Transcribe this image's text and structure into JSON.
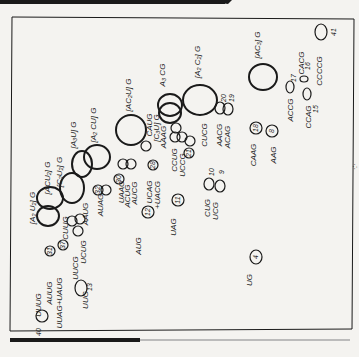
{
  "figure": {
    "type": "2D oligonucleotide fingerprint map (rotated)",
    "ink_color": "#1a1a1a",
    "paper_color": "#f4f3f0",
    "frame": {
      "x": 12,
      "y": 17,
      "w": 342,
      "h": 310
    }
  },
  "spots": [
    {
      "id": "spot-40",
      "label": "UUUG",
      "num": "40",
      "cx": 42,
      "cy": 316,
      "rx": 6,
      "ry": 6,
      "lx": 41,
      "ly": 305,
      "nx": 41,
      "ny": 332
    },
    {
      "id": "spot-13",
      "label": "UUG",
      "num": "13",
      "cx": 81,
      "cy": 288,
      "rx": 6,
      "ry": 8,
      "lx": 88,
      "ly": 300,
      "nx": 92,
      "ny": 287
    },
    {
      "id": "spot-auug",
      "label": "AUUG",
      "num": "",
      "cx": 0,
      "cy": 0,
      "rx": 0,
      "ry": 0,
      "lx": 52,
      "ly": 293
    },
    {
      "id": "spot-uuag",
      "label": "UUAG+UAUG",
      "num": "",
      "cx": 0,
      "cy": 0,
      "rx": 0,
      "ry": 0,
      "lx": 62,
      "ly": 303
    },
    {
      "id": "spot-31",
      "label": "",
      "num": "31",
      "cx": 50,
      "cy": 251,
      "rx": 5,
      "ry": 5
    },
    {
      "id": "spot-37",
      "label": "",
      "num": "37",
      "cx": 63,
      "cy": 245,
      "rx": 5,
      "ry": 5
    },
    {
      "id": "spot-uucg",
      "label": "UUCG",
      "num": "",
      "cx": 0,
      "cy": 0,
      "rx": 0,
      "ry": 0,
      "lx": 78,
      "ly": 268
    },
    {
      "id": "spot-ucug",
      "label": "UCUG",
      "num": "",
      "cx": 0,
      "cy": 0,
      "rx": 0,
      "ry": 0,
      "lx": 86,
      "ly": 252
    },
    {
      "id": "spot-aaug",
      "label": "AAUG",
      "num": "",
      "cx": 0,
      "cy": 0,
      "rx": 0,
      "ry": 0,
      "lx": 88,
      "ly": 214
    },
    {
      "id": "spot-cuug",
      "label": "CUUG",
      "num": "",
      "cx": 0,
      "cy": 0,
      "rx": 0,
      "ry": 0,
      "lx": 68,
      "ly": 228
    },
    {
      "id": "spot-29",
      "label": "",
      "num": "",
      "cx": 72,
      "cy": 221,
      "rx": 5,
      "ry": 5
    },
    {
      "id": "spot-33",
      "label": "",
      "num": "",
      "cx": 78,
      "cy": 231,
      "rx": 5,
      "ry": 5
    },
    {
      "id": "spot-34",
      "label": "",
      "num": "",
      "cx": 80,
      "cy": 219,
      "rx": 5,
      "ry": 5
    },
    {
      "id": "spot-a2u2",
      "label": "[A₂ U₂] G",
      "num": "",
      "cx": 50,
      "cy": 198,
      "rx": 13,
      "ry": 11,
      "cx2": 48,
      "cy2": 216,
      "rx2": 11,
      "ry2": 10,
      "lx": 35,
      "ly": 208
    },
    {
      "id": "spot-acu2",
      "label": "[ACU₂] G",
      "num": "",
      "cx": 72,
      "cy": 188,
      "rx": 12,
      "ry": 15,
      "lx": 50,
      "ly": 178
    },
    {
      "id": "spot-c2u2",
      "label": "[C₂U₂] G",
      "num": "",
      "cx": 0,
      "cy": 0,
      "rx": 0,
      "ry": 0,
      "lx": 62,
      "ly": 172
    },
    {
      "id": "spot-a3u",
      "label": "[A₃U] G",
      "num": "",
      "cx": 82,
      "cy": 164,
      "rx": 10,
      "ry": 13,
      "cx2": 97,
      "cy2": 157,
      "rx2": 13,
      "ry2": 12,
      "lx": 76,
      "ly": 135
    },
    {
      "id": "spot-a2cu",
      "label": "[A₂ CU] G",
      "num": "",
      "cx": 0,
      "cy": 0,
      "rx": 0,
      "ry": 0,
      "lx": 96,
      "ly": 125
    },
    {
      "id": "spot-auag",
      "label": "AUAG",
      "num": "",
      "cx": 0,
      "cy": 0,
      "rx": 0,
      "ry": 0,
      "lx": 103,
      "ly": 205
    },
    {
      "id": "spot-32",
      "label": "",
      "num": "32",
      "cx": 98,
      "cy": 190,
      "rx": 5,
      "ry": 5
    },
    {
      "id": "spot-32b",
      "label": "",
      "num": "",
      "cx": 106,
      "cy": 190,
      "rx": 5,
      "ry": 5
    },
    {
      "id": "spot-aca",
      "label": "",
      "num": "",
      "cx": 123,
      "cy": 164,
      "rx": 5,
      "ry": 5
    },
    {
      "id": "spot-acb",
      "label": "",
      "num": "",
      "cx": 131,
      "cy": 164,
      "rx": 5,
      "ry": 5
    },
    {
      "id": "spot-uaag",
      "label": "UAAG",
      "num": "",
      "cx": 0,
      "cy": 0,
      "rx": 0,
      "ry": 0,
      "lx": 124,
      "ly": 192
    },
    {
      "id": "spot-acug",
      "label": "ACUG",
      "num": "",
      "cx": 0,
      "cy": 0,
      "rx": 0,
      "ry": 0,
      "lx": 130,
      "ly": 196
    },
    {
      "id": "spot-aucg",
      "label": "AUCG",
      "num": "",
      "cx": 0,
      "cy": 0,
      "rx": 0,
      "ry": 0,
      "lx": 137,
      "ly": 193
    },
    {
      "id": "spot-30",
      "label": "",
      "num": "30",
      "cx": 119,
      "cy": 179,
      "rx": 5,
      "ry": 5
    },
    {
      "id": "spot-ac2u",
      "label": "[AC₂U] G",
      "num": "",
      "cx": 131,
      "cy": 130,
      "rx": 15,
      "ry": 15,
      "lx": 131,
      "ly": 95
    },
    {
      "id": "spot-caug",
      "label": "CAUG",
      "num": "",
      "cx": 0,
      "cy": 0,
      "rx": 0,
      "ry": 0,
      "lx": 152,
      "ly": 125
    },
    {
      "id": "spot-c3u",
      "label": "[C₃U] G",
      "num": "",
      "cx": 0,
      "cy": 0,
      "rx": 0,
      "ry": 0,
      "lx": 159,
      "ly": 128
    },
    {
      "id": "spot-aaag",
      "label": "AAAG",
      "num": "",
      "cx": 0,
      "cy": 0,
      "rx": 0,
      "ry": 0,
      "lx": 166,
      "ly": 137
    },
    {
      "id": "spot-26",
      "label": "",
      "num": "",
      "cx": 146,
      "cy": 146,
      "rx": 5,
      "ry": 5
    },
    {
      "id": "spot-28",
      "label": "",
      "num": "28",
      "cx": 153,
      "cy": 165,
      "rx": 5,
      "ry": 5
    },
    {
      "id": "spot-ucag",
      "label": "UCAG",
      "num": "",
      "cx": 0,
      "cy": 0,
      "rx": 0,
      "ry": 0,
      "lx": 152,
      "ly": 192
    },
    {
      "id": "spot-uacg",
      "label": "+UACG",
      "num": "",
      "cx": 0,
      "cy": 0,
      "rx": 0,
      "ry": 0,
      "lx": 160,
      "ly": 195
    },
    {
      "id": "spot-12",
      "label": "AUG",
      "num": "12",
      "cx": 148,
      "cy": 212,
      "rx": 6,
      "ry": 6,
      "lx": 141,
      "ly": 246
    },
    {
      "id": "spot-11",
      "label": "UAG",
      "num": "11",
      "cx": 178,
      "cy": 200,
      "rx": 6,
      "ry": 6,
      "lx": 176,
      "ly": 227
    },
    {
      "id": "spot-a3c",
      "label": "A₃ CG",
      "num": "",
      "cx": 170,
      "cy": 105,
      "rx": 12,
      "ry": 11,
      "cx2": 170,
      "cy2": 113,
      "rx2": 11,
      "ry2": 10,
      "lx": 165,
      "ly": 75
    },
    {
      "id": "spot-ccug",
      "label": "CCUG",
      "num": "",
      "cx": 0,
      "cy": 0,
      "rx": 0,
      "ry": 0,
      "lx": 177,
      "ly": 160
    },
    {
      "id": "spot-uccg",
      "label": "UCCG",
      "num": "",
      "cx": 0,
      "cy": 0,
      "rx": 0,
      "ry": 0,
      "lx": 185,
      "ly": 165
    },
    {
      "id": "spot-25",
      "label": "",
      "num": "",
      "cx": 176,
      "cy": 128,
      "rx": 5,
      "ry": 5
    },
    {
      "id": "spot-27",
      "label": "",
      "num": "",
      "cx": 175,
      "cy": 137,
      "rx": 5,
      "ry": 5
    },
    {
      "id": "spot-24",
      "label": "",
      "num": "",
      "cx": 182,
      "cy": 137,
      "rx": 5,
      "ry": 5
    },
    {
      "id": "spot-22",
      "label": "",
      "num": "",
      "cx": 190,
      "cy": 141,
      "rx": 5,
      "ry": 5
    },
    {
      "id": "spot-21",
      "label": "",
      "num": "21",
      "cx": 189,
      "cy": 153,
      "rx": 5,
      "ry": 5
    },
    {
      "id": "spot-cucg",
      "label": "CUCG",
      "num": "",
      "cx": 0,
      "cy": 0,
      "rx": 0,
      "ry": 0,
      "lx": 207,
      "ly": 135
    },
    {
      "id": "spot-a2c2",
      "label": "[A₂ C₂] G",
      "num": "",
      "cx": 200,
      "cy": 100,
      "rx": 17,
      "ry": 15,
      "lx": 200,
      "ly": 62
    },
    {
      "id": "spot-10",
      "label": "CUG",
      "num": "10",
      "cx": 209,
      "cy": 184,
      "rx": 5,
      "ry": 6,
      "lx": 210,
      "ly": 208,
      "nx": 214,
      "ny": 172
    },
    {
      "id": "spot-9",
      "label": "UCG",
      "num": "9",
      "cx": 220,
      "cy": 186,
      "rx": 5,
      "ry": 6,
      "lx": 218,
      "ly": 211,
      "nx": 224,
      "ny": 172
    },
    {
      "id": "spot-4",
      "label": "UG",
      "num": "4",
      "cx": 256,
      "cy": 257,
      "rx": 6,
      "ry": 7,
      "lx": 252,
      "ly": 280
    },
    {
      "id": "spot-20",
      "label": "AACG",
      "num": "20",
      "cx": 220,
      "cy": 108,
      "rx": 5,
      "ry": 6,
      "lx": 222,
      "ly": 135,
      "nx": 226,
      "ny": 98
    },
    {
      "id": "spot-19",
      "label": "ACAG",
      "num": "19",
      "cx": 228,
      "cy": 109,
      "rx": 5,
      "ry": 6,
      "lx": 230,
      "ly": 137,
      "nx": 234,
      "ny": 98
    },
    {
      "id": "spot-18",
      "label": "CAAG",
      "num": "18",
      "cx": 256,
      "cy": 128,
      "rx": 6,
      "ry": 6,
      "lx": 256,
      "ly": 155
    },
    {
      "id": "spot-8",
      "label": "AAG",
      "num": "8",
      "cx": 272,
      "cy": 131,
      "rx": 6,
      "ry": 6,
      "lx": 276,
      "ly": 155
    },
    {
      "id": "spot-ac3",
      "label": "[AC₃] G",
      "num": "",
      "cx": 263,
      "cy": 77,
      "rx": 14,
      "ry": 13,
      "lx": 260,
      "ly": 45
    },
    {
      "id": "spot-17",
      "label": "ACCG",
      "num": "17",
      "cx": 290,
      "cy": 87,
      "rx": 4,
      "ry": 6,
      "lx": 293,
      "ly": 110,
      "nx": 296,
      "ny": 78
    },
    {
      "id": "spot-16",
      "label": "CACG",
      "num": "16",
      "cx": 304,
      "cy": 79,
      "rx": 4,
      "ry": 3,
      "lx": 304,
      "ly": 63,
      "nx": 310,
      "ny": 66
    },
    {
      "id": "spot-15",
      "label": "CCAG",
      "num": "15",
      "cx": 307,
      "cy": 94,
      "rx": 4,
      "ry": 6,
      "lx": 311,
      "ly": 117,
      "nx": 318,
      "ny": 109
    },
    {
      "id": "spot-41",
      "label": "CCCCG",
      "num": "41",
      "cx": 321,
      "cy": 32,
      "rx": 6,
      "ry": 8,
      "lx": 322,
      "ly": 71,
      "nx": 336,
      "ny": 32
    }
  ]
}
